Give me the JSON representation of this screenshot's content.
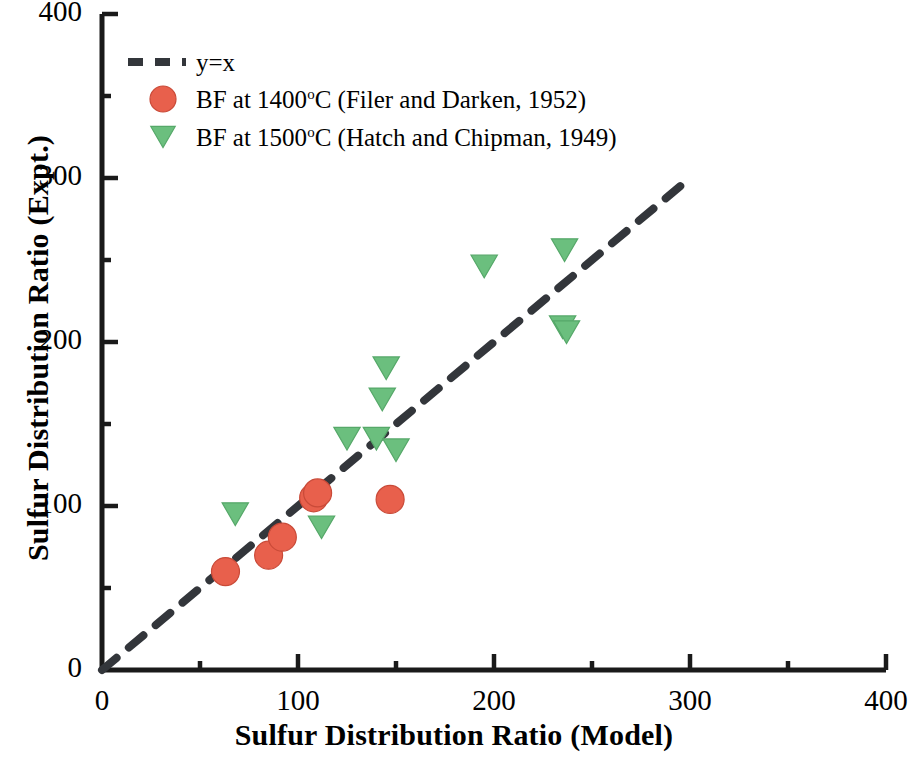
{
  "chart_data": {
    "type": "scatter",
    "title": "",
    "xlabel": "Sulfur Distribution Ratio (Model)",
    "ylabel": "Sulfur Distribution Ratio (Expt.)",
    "xlim": [
      0,
      400
    ],
    "ylim": [
      0,
      400
    ],
    "xticks": [
      0,
      100,
      200,
      300,
      400
    ],
    "yticks": [
      0,
      100,
      200,
      300,
      400
    ],
    "xtick_labels": [
      "0",
      "100",
      "200",
      "300",
      "400"
    ],
    "ytick_labels": [
      "0",
      "100",
      "200",
      "300",
      "400"
    ],
    "minor_tick_interval": 50,
    "grid": false,
    "legend_position": "upper left",
    "series": [
      {
        "name": "y=x",
        "type": "line",
        "style": "dashed",
        "color": "#33363B",
        "legend_label": "y=x",
        "points": [
          [
            0,
            0
          ],
          [
            300,
            300
          ]
        ]
      },
      {
        "name": "BF at 1400C (Filer and Darken, 1952)",
        "type": "scatter",
        "marker": "circle",
        "color": "#E8604C",
        "legend_label_prefix": "BF at 1400",
        "legend_label_sup": "o",
        "legend_label_suffix": "C (Filer and Darken, 1952)",
        "points": [
          [
            63,
            60
          ],
          [
            85,
            70
          ],
          [
            92,
            81
          ],
          [
            108,
            105
          ],
          [
            110,
            108
          ],
          [
            147,
            104
          ]
        ]
      },
      {
        "name": "BF at 1500C (Hatch and Chipman, 1949)",
        "type": "scatter",
        "marker": "triangle-down",
        "color": "#6BBF7E",
        "legend_label_prefix": "BF at 1500",
        "legend_label_sup": "o",
        "legend_label_suffix": "C (Hatch and Chipman, 1949)",
        "points": [
          [
            68,
            95
          ],
          [
            112,
            87
          ],
          [
            125,
            141
          ],
          [
            140,
            141
          ],
          [
            143,
            165
          ],
          [
            145,
            184
          ],
          [
            150,
            134
          ],
          [
            195,
            246
          ],
          [
            236,
            256
          ],
          [
            235,
            209
          ],
          [
            237,
            206
          ]
        ]
      }
    ]
  },
  "axes": {
    "x_title": "Sulfur Distribution Ratio (Model)",
    "y_title": "Sulfur Distribution Ratio (Expt.)"
  },
  "ticks": {
    "x": [
      "0",
      "100",
      "200",
      "300",
      "400"
    ],
    "y": [
      "0",
      "100",
      "200",
      "300",
      "400"
    ]
  },
  "legend": {
    "items": [
      {
        "label": "y=x",
        "marker": "dashed-line",
        "color": "#33363B"
      },
      {
        "label_pre": "BF at 1400",
        "label_sup": "o",
        "label_post": "C (Filer and Darken, 1952)",
        "marker": "circle",
        "color": "#E8604C"
      },
      {
        "label_pre": "BF at 1500",
        "label_sup": "o",
        "label_post": "C (Hatch and Chipman, 1949)",
        "marker": "triangle-down",
        "color": "#6BBF7E"
      }
    ]
  }
}
